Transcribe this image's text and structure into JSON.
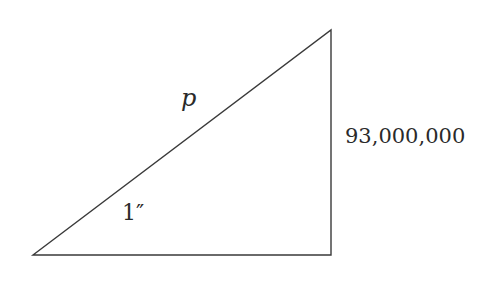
{
  "diagram": {
    "type": "right-triangle",
    "vertices": {
      "left": [
        33,
        255
      ],
      "right_bottom": [
        331,
        255
      ],
      "top": [
        331,
        30
      ]
    },
    "line_color": "#3a3a3a",
    "text_color": "#2a2a2a",
    "labels": {
      "hypotenuse": "p",
      "angle": "1″",
      "vertical_side": "93,000,000"
    }
  }
}
